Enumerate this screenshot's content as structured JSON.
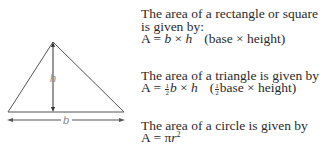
{
  "figure": {
    "type": "triangle",
    "height_label": "h",
    "base_label": "b",
    "stroke_color": "#555555",
    "label_color": "#8a8a8a"
  },
  "rectangle": {
    "line1": "The area of a rectangle or square",
    "line2": "is given by:",
    "formula_prefix": "A = ",
    "var_b": "b",
    "times": " × ",
    "var_h": "h",
    "note": "(base × height)"
  },
  "triangle": {
    "line1": "The area of a triangle is given by",
    "formula_prefix": "A = ",
    "frac_num": "1",
    "frac_den": "2",
    "var_b": "b",
    "times": " × ",
    "var_h": "h",
    "note_open": "(",
    "note_rest": "base × height)"
  },
  "circle": {
    "line1": "The area of a circle is given by",
    "formula_prefix": "A = ",
    "pi": "π",
    "var_r": "r",
    "exp": "2"
  }
}
